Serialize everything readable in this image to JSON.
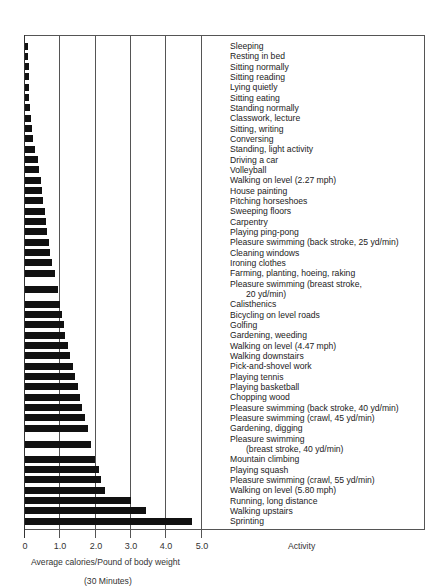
{
  "chart_data": {
    "type": "bar",
    "orientation": "horizontal",
    "title": "",
    "xlabel": "Average calories/Pound of body weight",
    "xlabel_sub": "(30 Minutes)",
    "ylabel": "Activity",
    "xlim": [
      0,
      5.0
    ],
    "xticks": [
      "0",
      "1.0",
      "2.0",
      "3.0",
      "4.0",
      "5.0"
    ],
    "grid": "vertical lines at each 1.0",
    "categories": [
      "Sleeping",
      "Resting in bed",
      "Sitting normally",
      "Sitting reading",
      "Lying quietly",
      "Sitting eating",
      "Standing normally",
      "Classwork, lecture",
      "Sitting, writing",
      "Conversing",
      "Standing, light activity",
      "Driving a car",
      "Volleyball",
      "Walking on level (2.27 mph)",
      "House painting",
      "Pitching horseshoes",
      "Sweeping floors",
      "Carpentry",
      "Playing ping-pong",
      "Pleasure swimming (back stroke, 25 yd/min)",
      "Cleaning windows",
      "Ironing clothes",
      "Farming, planting, hoeing, raking",
      "Pleasure swimming (breast stroke, 20 yd/min)",
      "Calisthenics",
      "Bicycling on level roads",
      "Golfing",
      "Gardening, weeding",
      "Walking on level (4.47 mph)",
      "Walking downstairs",
      "Pick-and-shovel work",
      "Playing tennis",
      "Playing basketball",
      "Chopping wood",
      "Pleasure swimming (back stroke, 40 yd/min)",
      "Pleasure swimming (crawl, 45 yd/min)",
      "Gardening, digging",
      "Pleasure swimming (breast stroke, 40 yd/min)",
      "Mountain climbing",
      "Playing squash",
      "Pleasure swimming (crawl, 55 yd/min)",
      "Walking on level (5.80 mph)",
      "Running, long distance",
      "Walking upstairs",
      "Sprinting"
    ],
    "values": [
      0.08,
      0.08,
      0.1,
      0.1,
      0.1,
      0.12,
      0.14,
      0.17,
      0.2,
      0.24,
      0.28,
      0.36,
      0.4,
      0.45,
      0.48,
      0.52,
      0.56,
      0.59,
      0.63,
      0.68,
      0.72,
      0.76,
      0.84,
      0.95,
      1.0,
      1.05,
      1.1,
      1.15,
      1.21,
      1.27,
      1.36,
      1.41,
      1.5,
      1.57,
      1.62,
      1.7,
      1.8,
      1.88,
      2.0,
      2.1,
      2.16,
      2.27,
      3.0,
      3.45,
      4.75
    ]
  },
  "labels": {
    "l1": "Sleeping",
    "l2": "Resting in bed",
    "l3": "Sitting normally",
    "l4": "Sitting reading",
    "l5": "Lying quietly",
    "l6": "Sitting eating",
    "l7": "Standing normally",
    "l8": "Classwork, lecture",
    "l9": "Sitting, writing",
    "l10": "Conversing",
    "l11": "Standing, light activity",
    "l12": "Driving a car",
    "l13": "Volleyball",
    "l14": "Walking on level (2.27 mph)",
    "l15": "House painting",
    "l16": "Pitching horseshoes",
    "l17": "Sweeping floors",
    "l18": "Carpentry",
    "l19": "Playing ping-pong",
    "l20": "Pleasure swimming (back stroke, 25 yd/min)",
    "l21": "Cleaning windows",
    "l22": "Ironing clothes",
    "l23": "Farming, planting, hoeing, raking",
    "l24": "Pleasure swimming (breast stroke,",
    "l25": "20 yd/min)",
    "l26": "Calisthenics",
    "l27": "Bicycling on level roads",
    "l28": "Golfing",
    "l29": "Gardening, weeding",
    "l30": "Walking on level (4.47 mph)",
    "l31": "Walking downstairs",
    "l32": "Pick-and-shovel work",
    "l33": "Playing tennis",
    "l34": "Playing basketball",
    "l35": "Chopping wood",
    "l36": "Pleasure swimming (back stroke, 40 yd/min)",
    "l37": "Pleasure swimming (crawl, 45 yd/min)",
    "l38": "Gardening, digging",
    "l39": "Pleasure swimming",
    "l40": "(breast stroke, 40 yd/min)",
    "l41": "Mountain climbing",
    "l42": "Playing squash",
    "l43": "Pleasure swimming (crawl, 55 yd/min)",
    "l44": "Walking on level (5.80 mph)",
    "l45": "Running, long distance",
    "l46": "Walking upstairs",
    "l47": "Sprinting"
  },
  "axis": {
    "t0": "0",
    "t1": "1.0",
    "t2": "2.0",
    "t3": "3.0",
    "t4": "4.0",
    "t5": "5.0",
    "xlabel": "Average calories/Pound of body weight",
    "xsub": "(30 Minutes)",
    "activity": "Activity"
  }
}
